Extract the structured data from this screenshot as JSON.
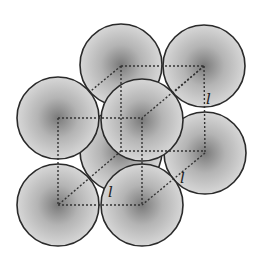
{
  "diagram": {
    "background": "#ffffff",
    "sphere": {
      "radius": 41,
      "fill_light": "#d9d9d9",
      "fill_dark": "#7a7a7a",
      "stroke": "#2a2a2a"
    },
    "edge_style": {
      "color": "#333333",
      "dash": "2 2"
    },
    "edge_label": "l",
    "spheres": [
      {
        "id": "back-bottom-left",
        "cx": 121,
        "cy": 151
      },
      {
        "id": "back-top-left",
        "cx": 121,
        "cy": 65
      },
      {
        "id": "back-top-right",
        "cx": 204,
        "cy": 66
      },
      {
        "id": "front-top-left",
        "cx": 58,
        "cy": 118
      },
      {
        "id": "back-bottom-right",
        "cx": 205,
        "cy": 153
      },
      {
        "id": "front-top-right",
        "cx": 142,
        "cy": 120
      },
      {
        "id": "front-bottom-left",
        "cx": 58,
        "cy": 205
      },
      {
        "id": "front-bottom-right",
        "cx": 142,
        "cy": 205
      }
    ],
    "labels": [
      {
        "id": "label-back-right-edge",
        "text": "l",
        "x": 206,
        "y": 100
      },
      {
        "id": "label-front-bottom",
        "text": "l",
        "x": 110,
        "y": 201
      },
      {
        "id": "label-right-bottom",
        "text": "l",
        "x": 181,
        "y": 181
      }
    ]
  }
}
